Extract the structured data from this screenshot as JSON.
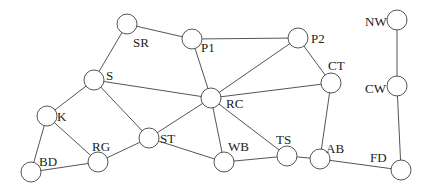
{
  "diagram": {
    "type": "network-graph",
    "node_radius": 10,
    "colors": {
      "edge": "#555555",
      "node_fill": "#ffffff",
      "node_stroke": "#555555",
      "label": "#222222"
    },
    "nodes": [
      {
        "id": "SR",
        "label": "SR",
        "x": 127,
        "y": 24,
        "lx": 133,
        "ly": 47
      },
      {
        "id": "P1",
        "label": "P1",
        "x": 192,
        "y": 39,
        "lx": 201,
        "ly": 52
      },
      {
        "id": "P2",
        "label": "P2",
        "x": 298,
        "y": 38,
        "lx": 311,
        "ly": 43
      },
      {
        "id": "NW",
        "label": "NW",
        "x": 397,
        "y": 20,
        "lx": 365,
        "ly": 26
      },
      {
        "id": "S",
        "label": "S",
        "x": 94,
        "y": 80,
        "lx": 106,
        "ly": 80
      },
      {
        "id": "CT",
        "label": "CT",
        "x": 331,
        "y": 83,
        "lx": 328,
        "ly": 70
      },
      {
        "id": "CW",
        "label": "CW",
        "x": 397,
        "y": 86,
        "lx": 365,
        "ly": 93
      },
      {
        "id": "RC",
        "label": "RC",
        "x": 211,
        "y": 98,
        "lx": 226,
        "ly": 108
      },
      {
        "id": "K",
        "label": "K",
        "x": 47,
        "y": 116,
        "lx": 57,
        "ly": 121
      },
      {
        "id": "ST",
        "label": "ST",
        "x": 149,
        "y": 138,
        "lx": 160,
        "ly": 143
      },
      {
        "id": "RG",
        "label": "RG",
        "x": 98,
        "y": 162,
        "lx": 92,
        "ly": 151
      },
      {
        "id": "BD",
        "label": "BD",
        "x": 31,
        "y": 172,
        "lx": 39,
        "ly": 166
      },
      {
        "id": "WB",
        "label": "WB",
        "x": 224,
        "y": 162,
        "lx": 228,
        "ly": 151
      },
      {
        "id": "TS",
        "label": "TS",
        "x": 287,
        "y": 156,
        "lx": 276,
        "ly": 144
      },
      {
        "id": "AB",
        "label": "AB",
        "x": 320,
        "y": 159,
        "lx": 326,
        "ly": 153
      },
      {
        "id": "FD",
        "label": "FD",
        "x": 401,
        "y": 170,
        "lx": 370,
        "ly": 162
      }
    ],
    "edges": [
      [
        "SR",
        "P1"
      ],
      [
        "P1",
        "P2"
      ],
      [
        "SR",
        "S"
      ],
      [
        "P1",
        "RC"
      ],
      [
        "P2",
        "RC"
      ],
      [
        "P2",
        "CT"
      ],
      [
        "S",
        "RC"
      ],
      [
        "CT",
        "RC"
      ],
      [
        "S",
        "K"
      ],
      [
        "S",
        "ST"
      ],
      [
        "K",
        "RG"
      ],
      [
        "K",
        "BD"
      ],
      [
        "BD",
        "RG"
      ],
      [
        "RG",
        "ST"
      ],
      [
        "ST",
        "RC"
      ],
      [
        "ST",
        "WB"
      ],
      [
        "RC",
        "WB"
      ],
      [
        "RC",
        "TS"
      ],
      [
        "WB",
        "TS"
      ],
      [
        "TS",
        "AB"
      ],
      [
        "CT",
        "AB"
      ],
      [
        "AB",
        "FD"
      ],
      [
        "NW",
        "CW"
      ],
      [
        "CW",
        "FD"
      ]
    ]
  }
}
